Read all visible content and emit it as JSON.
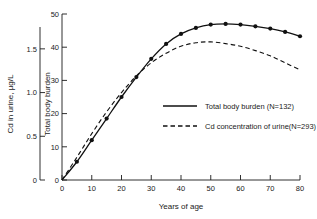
{
  "chart_data": {
    "type": "line",
    "title": "",
    "xlabel": "Years of age",
    "ylabel_left": "Cd in urine, µg/L",
    "ylabel_right": "Total body burden",
    "xlim": [
      0,
      80
    ],
    "xticks": [
      0,
      10,
      20,
      30,
      40,
      50,
      60,
      70,
      80
    ],
    "xticklabels": [
      "0",
      "10",
      "20",
      "30",
      "40",
      "50",
      "60",
      "70",
      "80"
    ],
    "y_left_lim": [
      0,
      1.75
    ],
    "y_left_ticks": [
      0,
      0.5,
      1.0,
      1.5
    ],
    "y_left_ticklabels": [
      "0",
      "0.5",
      "1.0",
      "1.5"
    ],
    "y_inner_lim": [
      0,
      50
    ],
    "y_inner_ticks": [
      0,
      10,
      20,
      30,
      40,
      50
    ],
    "y_inner_ticklabels": [
      "0",
      "10",
      "20",
      "30",
      "40",
      "50"
    ],
    "grid": false,
    "legend_position": "center-right",
    "series": [
      {
        "name": "Total body burden (N=132)",
        "style": "solid",
        "markers": true,
        "axis": "inner",
        "x": [
          0,
          5,
          10,
          15,
          20,
          25,
          30,
          35,
          40,
          45,
          50,
          55,
          60,
          65,
          70,
          75,
          80
        ],
        "values": [
          0,
          5.5,
          12.0,
          18.5,
          25.0,
          31.0,
          36.5,
          41.0,
          44.0,
          45.8,
          46.8,
          47.0,
          46.8,
          46.3,
          45.6,
          44.6,
          43.3
        ]
      },
      {
        "name": "Cd concentration of urine (N=293)",
        "style": "dashed",
        "markers": false,
        "axis": "left",
        "x": [
          0,
          5,
          10,
          15,
          20,
          25,
          30,
          35,
          40,
          45,
          50,
          55,
          60,
          65,
          70,
          75,
          80
        ],
        "values": [
          0,
          0.26,
          0.53,
          0.78,
          1.0,
          1.19,
          1.34,
          1.45,
          1.53,
          1.57,
          1.58,
          1.56,
          1.53,
          1.48,
          1.42,
          1.34,
          1.26
        ]
      }
    ]
  },
  "axes": {
    "x_title": "Years of age",
    "y_outer_title": "Cd in urine,  µg/L",
    "y_inner_title": "Total body burden"
  },
  "legend": {
    "entries": [
      {
        "label": "Total body burden (N=132)",
        "style": "solid"
      },
      {
        "label": "Cd concentration of urine(N=293)",
        "style": "dashed"
      }
    ]
  },
  "colors": {
    "ink": "#1a1a1a",
    "background": "#ffffff"
  }
}
